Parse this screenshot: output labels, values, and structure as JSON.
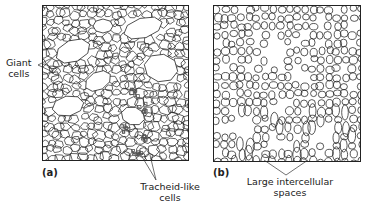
{
  "figure": {
    "panels": [
      {
        "id": "a",
        "letter": "(a)",
        "description": "Callus tissue section with giant cells and tracheid-like cells",
        "annotations": [
          {
            "text_lines": [
              "Giant",
              "cells"
            ]
          },
          {
            "text_lines": [
              "Tracheid-like",
              "cells"
            ]
          }
        ]
      },
      {
        "id": "b",
        "letter": "(b)",
        "description": "Loosely packed callus tissue section with large intercellular spaces",
        "annotations": [
          {
            "text_lines": [
              "Large intercellular",
              "spaces"
            ]
          }
        ]
      }
    ]
  },
  "colors": {
    "line": "#222222",
    "background": "#ffffff",
    "tracheid_shading": "#555555"
  }
}
